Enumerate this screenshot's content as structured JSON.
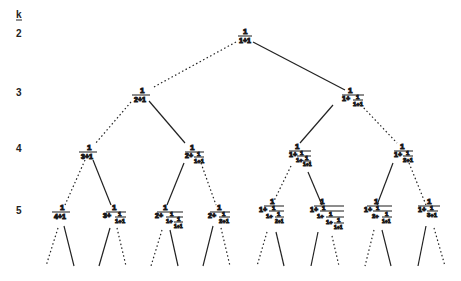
{
  "diagram": {
    "axis_label": "k",
    "levels": [
      {
        "k": "2",
        "y": 36
      },
      {
        "k": "3",
        "y": 95
      },
      {
        "k": "4",
        "y": 151
      },
      {
        "k": "5",
        "y": 213
      }
    ],
    "line_styles": {
      "dotted": "left child",
      "solid": "right child"
    },
    "nodes": [
      {
        "id": "n2",
        "level": 2,
        "expr": "1/(1+1)"
      },
      {
        "id": "n3a",
        "level": 3,
        "expr": "1/(2+1)"
      },
      {
        "id": "n3b",
        "level": 3,
        "expr": "1/(1+1/(1+1))"
      },
      {
        "id": "n4a",
        "level": 4,
        "expr": "1/(3+1)"
      },
      {
        "id": "n4b",
        "level": 4,
        "expr": "1/(2+1/(1+1))"
      },
      {
        "id": "n4c",
        "level": 4,
        "expr": "1/(1+1/(1+1/(1+1)))"
      },
      {
        "id": "n4d",
        "level": 4,
        "expr": "1/(1+1/(2+1))"
      },
      {
        "id": "n5a",
        "level": 5,
        "expr": "1/(4+1)"
      },
      {
        "id": "n5b",
        "level": 5,
        "expr": "1/(3+1/(1+1))"
      },
      {
        "id": "n5c",
        "level": 5,
        "expr": "1/(2+1/(1+1/(1+1)))"
      },
      {
        "id": "n5d",
        "level": 5,
        "expr": "1/(2+1/(2+1))"
      },
      {
        "id": "n5e",
        "level": 5,
        "expr": "1/(1+1/(1+1/(2+1)))"
      },
      {
        "id": "n5f",
        "level": 5,
        "expr": "1/(1+1/(1+1/(1+1/(1+1))))"
      },
      {
        "id": "n5g",
        "level": 5,
        "expr": "1/(1+1/(2+1/(1+1)))"
      },
      {
        "id": "n5h",
        "level": 5,
        "expr": "1/(1+1/(3+1))"
      }
    ],
    "text": {
      "one": "1",
      "plus": "+",
      "two": "2",
      "three": "3",
      "four": "4"
    }
  }
}
